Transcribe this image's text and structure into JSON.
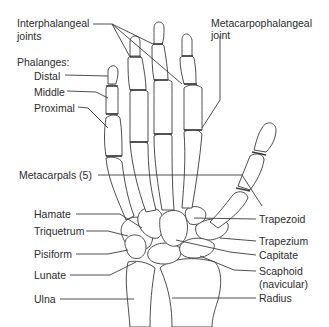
{
  "diagram": {
    "labels": {
      "interphalangeal_1": "Interphalangeal",
      "interphalangeal_2": "joints",
      "metacarpophalangeal_1": "Metacarpophalangeal",
      "metacarpophalangeal_2": "joint",
      "phalanges": "Phalanges:",
      "distal": "Distal",
      "middle": "Middle",
      "proximal": "Proximal",
      "metacarpals": "Metacarpals (5)",
      "hamate": "Hamate",
      "triquetrum": "Triquetrum",
      "pisiform": "Pisiform",
      "lunate": "Lunate",
      "ulna": "Ulna",
      "trapezoid": "Trapezoid",
      "trapezium": "Trapezium",
      "capitate": "Capitate",
      "scaphoid_1": "Scaphoid",
      "scaphoid_2": "(navicular)",
      "radius": "Radius"
    },
    "colors": {
      "line": "#3a3a3a",
      "text": "#2b2b2b",
      "background": "#ffffff"
    }
  }
}
